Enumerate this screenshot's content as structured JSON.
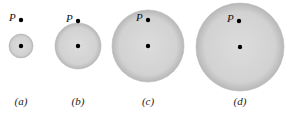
{
  "figure": {
    "sphere_color": "#d6d6d6",
    "sphere_edge": "#b5b5b5",
    "point_label": "P",
    "panels": [
      {
        "id": "a",
        "caption": "(a)",
        "cx": 21,
        "cy": 46,
        "r": 12,
        "px": 21,
        "py": 20
      },
      {
        "id": "b",
        "caption": "(b)",
        "cx": 78,
        "cy": 46,
        "r": 23,
        "px": 78,
        "py": 21
      },
      {
        "id": "c",
        "caption": "(c)",
        "cx": 148,
        "cy": 46,
        "r": 36,
        "px": 148,
        "py": 20
      },
      {
        "id": "d",
        "caption": "(d)",
        "cx": 240,
        "cy": 47,
        "r": 44,
        "px": 239,
        "py": 21
      }
    ]
  }
}
